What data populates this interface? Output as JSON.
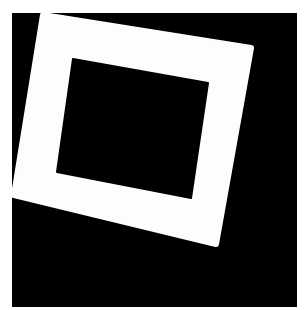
{
  "image": {
    "description": "Rotated white square frame (slide mount) on black background",
    "colors": {
      "page_background": "#ffffff",
      "field_background": "#000000",
      "frame": "#fdfdfd",
      "hole": "#000000"
    },
    "field": {
      "x": 12,
      "y": 13,
      "width": 285,
      "height": 294
    },
    "frame_outer": [
      [
        43,
        15
      ],
      [
        251,
        48
      ],
      [
        216,
        244
      ],
      [
        14,
        195
      ]
    ],
    "frame_inner": [
      [
        73,
        59
      ],
      [
        208,
        83
      ],
      [
        191,
        198
      ],
      [
        57,
        172
      ]
    ]
  }
}
